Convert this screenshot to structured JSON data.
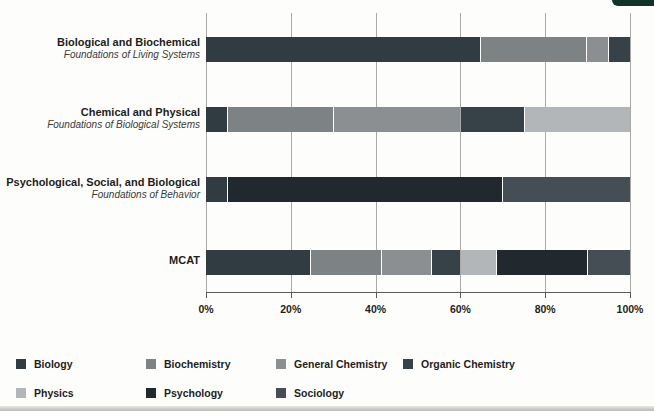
{
  "page": {
    "corner_tab_color": "#12332b",
    "background": "#fdfdfc"
  },
  "chart_data": {
    "type": "bar",
    "orientation": "horizontal",
    "stacked": true,
    "unit": "percent",
    "xlim": [
      0,
      100
    ],
    "x_ticks": [
      "0%",
      "20%",
      "40%",
      "60%",
      "80%",
      "100%"
    ],
    "x_tick_values": [
      0,
      20,
      40,
      60,
      80,
      100
    ],
    "grid": true,
    "gridline_color": "#a9a9a7",
    "legend_position": "bottom",
    "subjects": [
      {
        "name": "Biology",
        "color": "#313b42"
      },
      {
        "name": "Biochemistry",
        "color": "#7d8285"
      },
      {
        "name": "General Chemistry",
        "color": "#8b8f91"
      },
      {
        "name": "Organic Chemistry",
        "color": "#374148"
      },
      {
        "name": "Physics",
        "color": "#b3b6b8"
      },
      {
        "name": "Psychology",
        "color": "#21282e"
      },
      {
        "name": "Sociology",
        "color": "#454e55"
      }
    ],
    "rows": [
      {
        "label": "Biological and Biochemical",
        "sublabel": "Foundations of Living Systems",
        "segments": [
          {
            "subject": "Biology",
            "value": 65
          },
          {
            "subject": "Biochemistry",
            "value": 25
          },
          {
            "subject": "General Chemistry",
            "value": 5
          },
          {
            "subject": "Organic Chemistry",
            "value": 5
          }
        ]
      },
      {
        "label": "Chemical and Physical",
        "sublabel": "Foundations of Biological Systems",
        "segments": [
          {
            "subject": "Biology",
            "value": 5
          },
          {
            "subject": "Biochemistry",
            "value": 25
          },
          {
            "subject": "General Chemistry",
            "value": 30
          },
          {
            "subject": "Organic Chemistry",
            "value": 15
          },
          {
            "subject": "Physics",
            "value": 25
          }
        ]
      },
      {
        "label": "Psychological, Social, and Biological",
        "sublabel": "Foundations of Behavior",
        "segments": [
          {
            "subject": "Biology",
            "value": 5
          },
          {
            "subject": "Psychology",
            "value": 65
          },
          {
            "subject": "Sociology",
            "value": 30
          }
        ]
      },
      {
        "label": "MCAT",
        "sublabel": "",
        "segments": [
          {
            "subject": "Biology",
            "value": 25
          },
          {
            "subject": "Biochemistry",
            "value": 16.7
          },
          {
            "subject": "General Chemistry",
            "value": 11.7
          },
          {
            "subject": "Organic Chemistry",
            "value": 6.7
          },
          {
            "subject": "Physics",
            "value": 8.3
          },
          {
            "subject": "Psychology",
            "value": 21.7
          },
          {
            "subject": "Sociology",
            "value": 10
          }
        ]
      }
    ]
  }
}
